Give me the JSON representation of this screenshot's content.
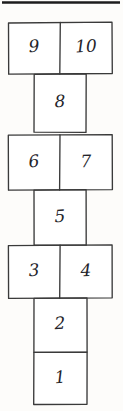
{
  "diagram": {
    "style": "hand-drawn ink sketch",
    "canvas": {
      "width": 123,
      "height": 411
    },
    "colors": {
      "background": "#fdfcfa",
      "cell_fill": "#ffffff",
      "stroke": "#3a3a3a",
      "top_rule": "#1c1c1c",
      "numeral": "#25242a"
    },
    "top_rule": {
      "x1": 2,
      "y1": 2.5,
      "x2": 120,
      "y2": 2.5
    },
    "cells": [
      {
        "number": "10",
        "kind": "wide-right",
        "x": 60,
        "y": 22,
        "w": 52,
        "h": 52,
        "label_x": 86,
        "label_y": 48,
        "rotate": -3
      },
      {
        "number": "9",
        "kind": "wide-left",
        "x": 8,
        "y": 22,
        "w": 52,
        "h": 52,
        "label_x": 34,
        "label_y": 48,
        "rotate": -4
      },
      {
        "number": "8",
        "kind": "narrow",
        "x": 34,
        "y": 74,
        "w": 52,
        "h": 58,
        "label_x": 60,
        "label_y": 103,
        "rotate": -2
      },
      {
        "number": "7",
        "kind": "wide-right",
        "x": 60,
        "y": 135,
        "w": 52,
        "h": 55,
        "label_x": 86,
        "label_y": 163,
        "rotate": -2
      },
      {
        "number": "6",
        "kind": "wide-left",
        "x": 8,
        "y": 135,
        "w": 52,
        "h": 55,
        "label_x": 34,
        "label_y": 163,
        "rotate": -5
      },
      {
        "number": "5",
        "kind": "narrow",
        "x": 34,
        "y": 190,
        "w": 52,
        "h": 55,
        "label_x": 60,
        "label_y": 218,
        "rotate": -3
      },
      {
        "number": "4",
        "kind": "wide-right",
        "x": 60,
        "y": 245,
        "w": 52,
        "h": 53,
        "label_x": 86,
        "label_y": 272,
        "rotate": -2
      },
      {
        "number": "3",
        "kind": "wide-left",
        "x": 8,
        "y": 245,
        "w": 52,
        "h": 53,
        "label_x": 34,
        "label_y": 272,
        "rotate": -4
      },
      {
        "number": "2",
        "kind": "narrow",
        "x": 34,
        "y": 298,
        "w": 53,
        "h": 54,
        "label_x": 60,
        "label_y": 325,
        "rotate": -3
      },
      {
        "number": "1",
        "kind": "narrow",
        "x": 34,
        "y": 352,
        "w": 53,
        "h": 52,
        "label_x": 60,
        "label_y": 379,
        "rotate": -4
      }
    ],
    "paths": {
      "row_9_10": "M 8.5 23 L 112 22.2 L 112.3 73.5 L 8.7 74.2 Z",
      "divider_9_10": "M 60.3 22.4 L 59.8 74.1",
      "cell_8": "M 34.2 74.3 L 86.2 73.8 L 86.0 132.4 L 34.0 132.2 Z",
      "row_6_7": "M 8.3 135.2 L 112.2 134.6 L 112.4 189.6 L 8.5 190.2 Z",
      "divider_6_7": "M 60.0 134.8 L 59.6 190.0",
      "cell_5": "M 34.0 190.1 L 86.1 189.7 L 86.2 245.2 L 34.1 245.0 Z",
      "row_3_4": "M 8.4 245.6 L 112.1 244.9 L 112.2 297.8 L 8.6 298.4 Z",
      "divider_3_4": "M 60.1 245.1 L 59.7 298.2",
      "cell_2": "M 34.0 298.3 L 87.0 297.9 L 87.1 352.1 L 33.9 352.3 Z",
      "cell_1": "M 33.9 352.3 L 87.1 352.1 L 87.0 404.3 L 33.7 404.5 Z"
    }
  }
}
